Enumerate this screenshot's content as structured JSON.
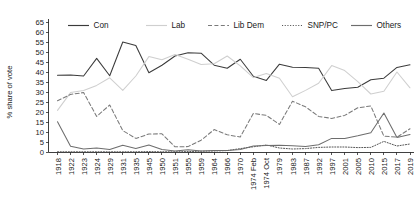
{
  "chart_data": {
    "type": "line",
    "title": "",
    "xlabel": "",
    "ylabel": "% share of vote",
    "ylim": [
      0,
      65
    ],
    "ytick_step": 5,
    "yticks": [
      0,
      5,
      10,
      15,
      20,
      25,
      30,
      35,
      40,
      45,
      50,
      55,
      60,
      65
    ],
    "grid": false,
    "legend_position": "top",
    "categories": [
      "1918",
      "1922",
      "1923",
      "1924",
      "1929",
      "1931",
      "1935",
      "1945",
      "1950",
      "1951",
      "1955",
      "1959",
      "1964",
      "1966",
      "1970",
      "1974 Feb",
      "1974 Oct",
      "1979",
      "1983",
      "1987",
      "1992",
      "1997",
      "2001",
      "2005",
      "2010",
      "2015",
      "2017",
      "2019"
    ],
    "series": [
      {
        "name": "Con",
        "color": "#3b3b3b",
        "style": "solid",
        "values": [
          38.4,
          38.5,
          38.0,
          46.8,
          38.1,
          55.0,
          53.3,
          39.6,
          43.4,
          48.0,
          49.6,
          49.4,
          43.4,
          41.9,
          46.4,
          37.9,
          35.8,
          43.9,
          42.4,
          42.2,
          41.9,
          30.7,
          31.7,
          32.4,
          36.1,
          36.9,
          42.3,
          43.6
        ]
      },
      {
        "name": "Lab",
        "color": "#cfcfcf",
        "style": "solid",
        "values": [
          20.8,
          29.7,
          30.7,
          33.3,
          37.1,
          30.8,
          38.0,
          47.7,
          46.1,
          48.8,
          46.4,
          43.8,
          44.1,
          48.0,
          43.1,
          37.2,
          39.2,
          36.9,
          27.6,
          30.8,
          34.4,
          43.2,
          40.7,
          35.2,
          29.0,
          30.4,
          40.0,
          32.1
        ]
      },
      {
        "name": "Lib Dem",
        "color": "#7a7a7a",
        "style": "dashed",
        "values": [
          25.6,
          28.8,
          29.7,
          17.8,
          23.5,
          10.7,
          6.8,
          9.0,
          9.1,
          2.6,
          2.7,
          5.9,
          11.2,
          8.6,
          7.5,
          19.3,
          18.3,
          13.8,
          25.4,
          22.6,
          17.8,
          16.8,
          18.3,
          22.1,
          23.0,
          7.9,
          7.4,
          11.6
        ]
      },
      {
        "name": "SNP/PC",
        "color": "#555555",
        "style": "dotted",
        "values": [
          0.1,
          0.1,
          0.1,
          0.1,
          0.1,
          0.1,
          0.1,
          0.2,
          0.1,
          0.1,
          0.2,
          0.4,
          0.5,
          0.7,
          1.7,
          2.6,
          3.5,
          2.0,
          1.5,
          1.7,
          2.3,
          2.5,
          2.5,
          2.2,
          2.3,
          5.3,
          3.0,
          4.0
        ]
      },
      {
        "name": "Others",
        "color": "#6d6d6d",
        "style": "solid",
        "values": [
          15.1,
          2.9,
          1.5,
          2.0,
          1.2,
          3.4,
          1.8,
          3.5,
          1.3,
          0.5,
          1.1,
          0.5,
          0.8,
          0.8,
          1.3,
          3.0,
          3.2,
          3.4,
          3.1,
          2.7,
          3.6,
          6.8,
          6.8,
          8.1,
          9.6,
          19.5,
          7.3,
          8.7
        ]
      }
    ]
  },
  "legend": {
    "items": [
      {
        "label": "Con"
      },
      {
        "label": "Lab"
      },
      {
        "label": "Lib Dem"
      },
      {
        "label": "SNP/PC"
      },
      {
        "label": "Others"
      }
    ]
  },
  "axes": {
    "y_title": "% share of vote"
  }
}
